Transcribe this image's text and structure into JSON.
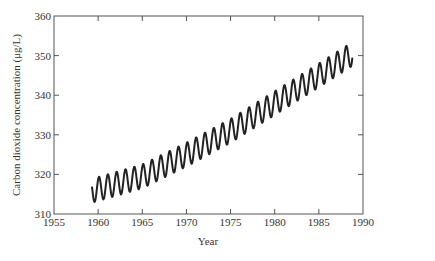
{
  "chart_data": {
    "type": "line",
    "title": "",
    "xlabel": "Year",
    "ylabel": "Carbon dioxide concentration (μg/L)",
    "xlim": [
      1955,
      1990
    ],
    "ylim": [
      310,
      360
    ],
    "xticks": [
      1955,
      1960,
      1965,
      1970,
      1975,
      1980,
      1985,
      1990
    ],
    "yticks": [
      310,
      320,
      330,
      340,
      350,
      360
    ],
    "grid": false,
    "legend": null,
    "series": [
      {
        "name": "CO2 concentration (Mauna Loa)",
        "description": "Seasonal oscillation (~1 cycle/year, amplitude ~3) on a rising trend",
        "x_start": 1959.3,
        "x_end": 1988.8,
        "trend": [
          {
            "x": 1959.5,
            "y": 316
          },
          {
            "x": 1965,
            "y": 319.5
          },
          {
            "x": 1970,
            "y": 325
          },
          {
            "x": 1975,
            "y": 331
          },
          {
            "x": 1980,
            "y": 338
          },
          {
            "x": 1985,
            "y": 345
          },
          {
            "x": 1988.5,
            "y": 350
          }
        ],
        "seasonal_amplitude": 3
      }
    ]
  },
  "axes": {
    "xlabel": "Year",
    "ylabel": "Carbon dioxide concentration (μg/L)",
    "xticks": [
      "1955",
      "1960",
      "1965",
      "1970",
      "1975",
      "1980",
      "1985",
      "1990"
    ],
    "yticks": [
      "310",
      "320",
      "330",
      "340",
      "350",
      "360"
    ]
  },
  "colors": {
    "line": "#222222",
    "axis": "#555555",
    "text": "#333333"
  }
}
